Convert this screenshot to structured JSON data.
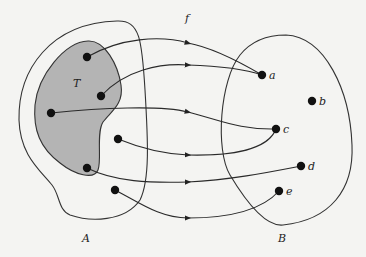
{
  "diagram": {
    "function_label": "f",
    "domain_set": {
      "label": "A"
    },
    "subset": {
      "label": "T",
      "fill": "#b4b4b4"
    },
    "codomain_set": {
      "label": "B"
    },
    "codomain_points": [
      {
        "id": "a",
        "label": "a"
      },
      {
        "id": "b",
        "label": "b"
      },
      {
        "id": "c",
        "label": "c"
      },
      {
        "id": "d",
        "label": "d"
      },
      {
        "id": "e",
        "label": "e"
      }
    ],
    "domain_points": [
      {
        "id": "p1",
        "in_subset": true,
        "maps_to": "a"
      },
      {
        "id": "p2",
        "in_subset": true,
        "maps_to": "a"
      },
      {
        "id": "p3",
        "in_subset": true,
        "maps_to": "c"
      },
      {
        "id": "p4",
        "in_subset": false,
        "maps_to": "c"
      },
      {
        "id": "p5",
        "in_subset": true,
        "maps_to": "d"
      },
      {
        "id": "p6",
        "in_subset": false,
        "maps_to": "e"
      }
    ]
  }
}
